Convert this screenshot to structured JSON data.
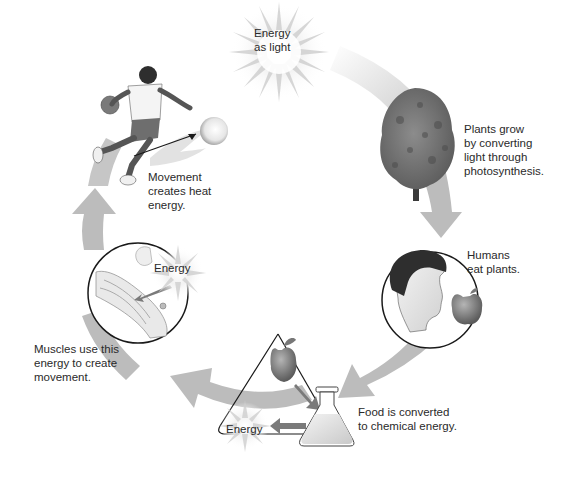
{
  "diagram": {
    "type": "energy-cycle",
    "colors": {
      "arrow": "#b9b9b9",
      "arrow_light": "#d8d8d8",
      "text": "#2a2a2a",
      "outline": "#1a1a1a",
      "tree": "#6e6e6e",
      "apple": "#7a7a7a",
      "starburst": "#cfcfcf"
    },
    "labels": {
      "light": "Energy\nas light",
      "plants": "Plants grow\nby converting\nlight through\nphotosynthesis.",
      "humans": "Humans\neat plants.",
      "food": "Food is converted\nto chemical energy.",
      "muscles": "Muscles use this\nenergy to create\nmovement.",
      "movement": "Movement\ncreates heat\nenergy."
    },
    "energy_tags": {
      "muscle_energy": "Energy",
      "chemical_energy": "Energy"
    },
    "stages": [
      {
        "id": "light",
        "icon": "sun-starburst-icon"
      },
      {
        "id": "plants",
        "icon": "tree-icon"
      },
      {
        "id": "humans",
        "icon": "human-head-icon"
      },
      {
        "id": "food",
        "icon": "flask-icon"
      },
      {
        "id": "muscles",
        "icon": "muscle-icon"
      },
      {
        "id": "movement",
        "icon": "basketball-player-icon"
      }
    ]
  }
}
